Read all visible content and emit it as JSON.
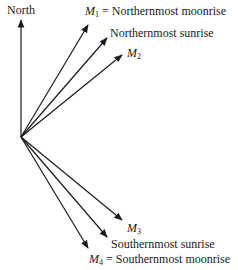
{
  "diagram": {
    "type": "direction-rays",
    "origin": {
      "x": 21,
      "y": 137
    },
    "north": {
      "label": "North",
      "end": {
        "x": 21,
        "y": 20
      }
    },
    "rays": [
      {
        "id": "m1",
        "symbol": "M",
        "sub": "1",
        "text": " = Northernmost moonrise",
        "end": {
          "x": 88,
          "y": 25
        }
      },
      {
        "id": "n-sunrise",
        "symbol": "",
        "sub": "",
        "text": "Northernmost sunrise",
        "end": {
          "x": 107,
          "y": 38
        }
      },
      {
        "id": "m2",
        "symbol": "M",
        "sub": "2",
        "text": "",
        "end": {
          "x": 122,
          "y": 55
        }
      },
      {
        "id": "m3",
        "symbol": "M",
        "sub": "3",
        "text": "",
        "end": {
          "x": 122,
          "y": 220
        }
      },
      {
        "id": "s-sunrise",
        "symbol": "",
        "sub": "",
        "text": "Southernmost sunrise",
        "end": {
          "x": 107,
          "y": 237
        }
      },
      {
        "id": "m4",
        "symbol": "M",
        "sub": "4",
        "text": " = Southernmost moonrise",
        "end": {
          "x": 88,
          "y": 248
        }
      }
    ],
    "line_color": "#1a1a1a"
  }
}
